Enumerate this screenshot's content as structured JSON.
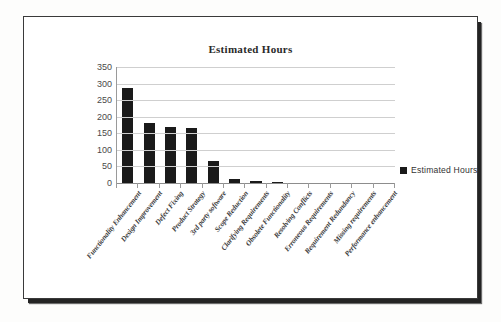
{
  "chart_data": {
    "type": "bar",
    "title": "Estimated Hours",
    "xlabel": "",
    "ylabel": "",
    "ylim": [
      0,
      350
    ],
    "ytick_step": 50,
    "yticks": [
      350,
      300,
      250,
      200,
      150,
      100,
      50,
      0
    ],
    "grid": true,
    "legend_position": "right",
    "bar_color": "#1a1a1a",
    "categories": [
      "Functionality Enhancement",
      "Design Improvement",
      "Defect Fixing",
      "Product Strategy",
      "3rd party software",
      "Scope Reduction",
      "Clarifying Requirements",
      "Obsolete Functionality",
      "Resolving Conflicts",
      "Erroneous Requirements",
      "Requirement Redundancy",
      "Missing requirements",
      "Performance enhancement"
    ],
    "series": [
      {
        "name": "Estimated Hours",
        "values": [
          287,
          181,
          170,
          166,
          66,
          12,
          6,
          3,
          0,
          0,
          0,
          0,
          0
        ]
      }
    ]
  },
  "legend": {
    "entries": [
      {
        "label": "Estimated Hours",
        "color": "#1a1a1a"
      }
    ]
  }
}
